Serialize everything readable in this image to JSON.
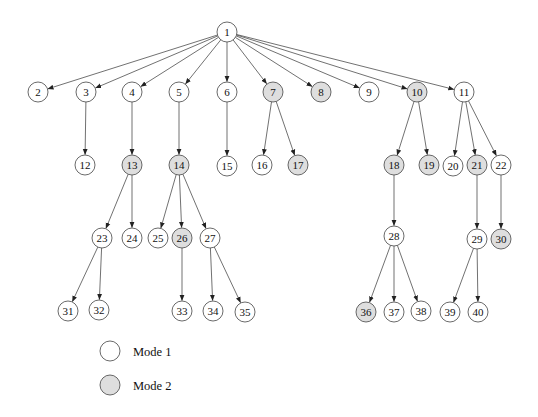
{
  "diagram": {
    "type": "tree",
    "node_radius": 10,
    "colors": {
      "mode1_fill": "#ffffff",
      "mode2_fill": "#dedede",
      "stroke": "#444444",
      "edge": "#333333"
    },
    "nodes": [
      {
        "id": "1",
        "x": 227,
        "y": 32,
        "mode": 1
      },
      {
        "id": "2",
        "x": 38,
        "y": 92,
        "mode": 1
      },
      {
        "id": "3",
        "x": 86,
        "y": 92,
        "mode": 1
      },
      {
        "id": "4",
        "x": 132,
        "y": 92,
        "mode": 1
      },
      {
        "id": "5",
        "x": 179,
        "y": 92,
        "mode": 1
      },
      {
        "id": "6",
        "x": 227,
        "y": 92,
        "mode": 1
      },
      {
        "id": "7",
        "x": 273,
        "y": 92,
        "mode": 2
      },
      {
        "id": "8",
        "x": 321,
        "y": 92,
        "mode": 2
      },
      {
        "id": "9",
        "x": 369,
        "y": 92,
        "mode": 1
      },
      {
        "id": "10",
        "x": 417,
        "y": 92,
        "mode": 2
      },
      {
        "id": "11",
        "x": 464,
        "y": 92,
        "mode": 1
      },
      {
        "id": "12",
        "x": 85,
        "y": 165,
        "mode": 1
      },
      {
        "id": "13",
        "x": 132,
        "y": 165,
        "mode": 2
      },
      {
        "id": "14",
        "x": 179,
        "y": 165,
        "mode": 2
      },
      {
        "id": "15",
        "x": 227,
        "y": 166,
        "mode": 1
      },
      {
        "id": "16",
        "x": 262,
        "y": 165,
        "mode": 1
      },
      {
        "id": "17",
        "x": 298,
        "y": 165,
        "mode": 2
      },
      {
        "id": "18",
        "x": 394,
        "y": 165,
        "mode": 2
      },
      {
        "id": "19",
        "x": 429,
        "y": 165,
        "mode": 2
      },
      {
        "id": "20",
        "x": 453,
        "y": 166,
        "mode": 1
      },
      {
        "id": "21",
        "x": 477,
        "y": 165,
        "mode": 2
      },
      {
        "id": "22",
        "x": 501,
        "y": 165,
        "mode": 1
      },
      {
        "id": "23",
        "x": 102,
        "y": 238,
        "mode": 1
      },
      {
        "id": "24",
        "x": 132,
        "y": 238,
        "mode": 1
      },
      {
        "id": "25",
        "x": 158,
        "y": 238,
        "mode": 1
      },
      {
        "id": "26",
        "x": 182,
        "y": 238,
        "mode": 2
      },
      {
        "id": "27",
        "x": 210,
        "y": 238,
        "mode": 1
      },
      {
        "id": "28",
        "x": 394,
        "y": 236,
        "mode": 1
      },
      {
        "id": "29",
        "x": 477,
        "y": 239,
        "mode": 1
      },
      {
        "id": "30",
        "x": 501,
        "y": 239,
        "mode": 2
      },
      {
        "id": "31",
        "x": 68,
        "y": 311,
        "mode": 1
      },
      {
        "id": "32",
        "x": 99,
        "y": 310,
        "mode": 1
      },
      {
        "id": "33",
        "x": 182,
        "y": 311,
        "mode": 1
      },
      {
        "id": "34",
        "x": 213,
        "y": 311,
        "mode": 1
      },
      {
        "id": "35",
        "x": 245,
        "y": 312,
        "mode": 1
      },
      {
        "id": "36",
        "x": 366,
        "y": 312,
        "mode": 2
      },
      {
        "id": "37",
        "x": 394,
        "y": 312,
        "mode": 1
      },
      {
        "id": "38",
        "x": 421,
        "y": 311,
        "mode": 1
      },
      {
        "id": "39",
        "x": 450,
        "y": 312,
        "mode": 1
      },
      {
        "id": "40",
        "x": 478,
        "y": 312,
        "mode": 1
      }
    ],
    "edges": [
      [
        "1",
        "2"
      ],
      [
        "1",
        "3"
      ],
      [
        "1",
        "4"
      ],
      [
        "1",
        "5"
      ],
      [
        "1",
        "6"
      ],
      [
        "1",
        "7"
      ],
      [
        "1",
        "8"
      ],
      [
        "1",
        "9"
      ],
      [
        "1",
        "10"
      ],
      [
        "1",
        "11"
      ],
      [
        "3",
        "12"
      ],
      [
        "4",
        "13"
      ],
      [
        "5",
        "14"
      ],
      [
        "6",
        "15"
      ],
      [
        "7",
        "16"
      ],
      [
        "7",
        "17"
      ],
      [
        "10",
        "18"
      ],
      [
        "10",
        "19"
      ],
      [
        "11",
        "20"
      ],
      [
        "11",
        "21"
      ],
      [
        "11",
        "22"
      ],
      [
        "13",
        "23"
      ],
      [
        "13",
        "24"
      ],
      [
        "14",
        "25"
      ],
      [
        "14",
        "26"
      ],
      [
        "14",
        "27"
      ],
      [
        "18",
        "28"
      ],
      [
        "21",
        "29"
      ],
      [
        "22",
        "30"
      ],
      [
        "23",
        "31"
      ],
      [
        "23",
        "32"
      ],
      [
        "26",
        "33"
      ],
      [
        "27",
        "34"
      ],
      [
        "27",
        "35"
      ],
      [
        "28",
        "36"
      ],
      [
        "28",
        "37"
      ],
      [
        "28",
        "38"
      ],
      [
        "29",
        "39"
      ],
      [
        "29",
        "40"
      ]
    ]
  },
  "legend": {
    "items": [
      {
        "label": "Mode 1",
        "mode": 1,
        "x": 110,
        "y": 351
      },
      {
        "label": "Mode 2",
        "mode": 2,
        "x": 110,
        "y": 385
      }
    ]
  }
}
